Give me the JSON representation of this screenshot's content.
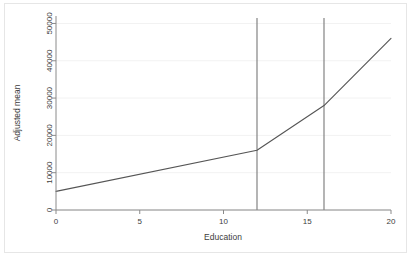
{
  "chart_data": {
    "type": "line",
    "title": "",
    "subtitle": "",
    "xlabel": "Education",
    "ylabel": "Adjusted mean",
    "xlim": [
      0,
      20
    ],
    "ylim": [
      0,
      52000
    ],
    "xticks": [
      0,
      5,
      10,
      15,
      20
    ],
    "xtick_labels": [
      "0",
      "5",
      "10",
      "15",
      "20"
    ],
    "yticks": [
      0,
      10000,
      20000,
      30000,
      40000,
      50000
    ],
    "ytick_labels": [
      "0",
      "10000",
      "20000",
      "30000",
      "40000",
      "50000"
    ],
    "grid": "horizontal-faint",
    "legend": "none",
    "series": [
      {
        "name": "Adjusted mean",
        "color": "#555555",
        "x": [
          0,
          12,
          16,
          20
        ],
        "values": [
          5000,
          16000,
          28000,
          46000
        ]
      }
    ],
    "reference_lines": [
      {
        "name": "high-school",
        "orientation": "vertical",
        "x": 12,
        "color": "#777777"
      },
      {
        "name": "college",
        "orientation": "vertical",
        "x": 16,
        "color": "#777777"
      }
    ],
    "annotations": []
  },
  "figure": {
    "background_color": "#ffffff",
    "frame_color": "#e6e6e6",
    "axis_color": "#8a8a8a",
    "text_color": "#3d3d3d"
  }
}
